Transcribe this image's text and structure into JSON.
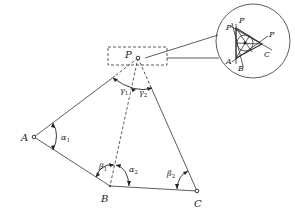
{
  "diagram": {
    "title": "",
    "points": {
      "P": {
        "label": "P",
        "x": 138,
        "y": 58
      },
      "A": {
        "label": "A",
        "x": 34,
        "y": 137
      },
      "B": {
        "label": "B",
        "x": 110,
        "y": 186
      },
      "C": {
        "label": "C",
        "x": 197,
        "y": 191
      }
    },
    "angles": {
      "alpha1": {
        "symbol": "α",
        "sub": "1"
      },
      "alpha2": {
        "symbol": "α",
        "sub": "2"
      },
      "beta1": {
        "symbol": "β",
        "sub": "1"
      },
      "beta2": {
        "symbol": "β",
        "sub": "2"
      },
      "gamma1": {
        "symbol": "γ",
        "sub": "1"
      },
      "gamma2": {
        "symbol": "γ",
        "sub": "2"
      }
    },
    "edges": [
      {
        "from": "P",
        "to": "A",
        "style": "solid"
      },
      {
        "from": "P",
        "to": "B",
        "style": "dashed"
      },
      {
        "from": "P",
        "to": "C",
        "style": "solid"
      },
      {
        "from": "A",
        "to": "B",
        "style": "solid"
      },
      {
        "from": "B",
        "to": "C",
        "style": "solid"
      }
    ],
    "magnified_view": {
      "labels": {
        "p1": "P",
        "p2": "P",
        "p3": "P",
        "a": "A",
        "b": "B",
        "c": "C"
      },
      "description": "Error triangle formed by three intersecting rays near P"
    },
    "colors": {
      "line": "#333333",
      "background": "#ffffff"
    }
  }
}
